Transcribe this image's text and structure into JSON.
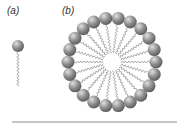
{
  "labels": {
    "a": "(a)",
    "b": "(b)"
  },
  "molecule": {
    "head_x": 18,
    "head_y": 46,
    "head_r": 6,
    "tail_end_y": 86
  },
  "micelle": {
    "cx": 112,
    "cy": 62,
    "ring_r": 44,
    "head_r": 6.5,
    "core_r": 9,
    "count": 22
  },
  "colors": {
    "head": "#8a8a8a",
    "head_light": "#d8d8d8",
    "tail": "#9a9a9a",
    "baseline": "#b0b0b0"
  }
}
